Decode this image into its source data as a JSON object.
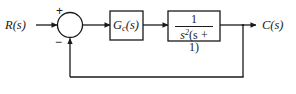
{
  "diagram": {
    "type": "control-system-block-diagram",
    "line_color": "#1a1a1a",
    "background_color": "#ffffff",
    "input": {
      "label": "R(s)",
      "name": "reference-input"
    },
    "output": {
      "label": "C(s)",
      "name": "controlled-output"
    },
    "summing_junction": {
      "name": "summing-junction",
      "positive_sign": "+",
      "negative_sign": "−"
    },
    "blocks": [
      {
        "name": "controller-block",
        "label": "G",
        "subscript": "c",
        "suffix": "(s)"
      },
      {
        "name": "plant-block",
        "numerator": "1",
        "denominator_base": "s",
        "denominator_exponent": "2",
        "denominator_factor": "(s + 1)"
      }
    ],
    "feedback": {
      "name": "unity-feedback-path",
      "gain": "1",
      "has_block": false
    }
  }
}
